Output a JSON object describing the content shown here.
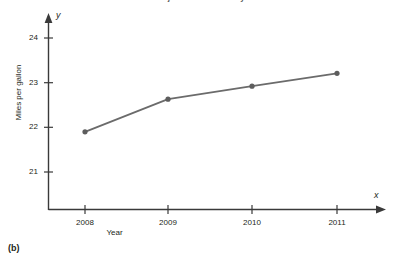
{
  "figure": {
    "label": "(b)",
    "title_fragment": "Projected fuel economy"
  },
  "chart_data": {
    "type": "line",
    "title": "",
    "xlabel": "Year",
    "ylabel": "Miles per gallon",
    "x_axis_variable": "x",
    "y_axis_variable": "y",
    "categories": [
      "2008",
      "2009",
      "2010",
      "2011"
    ],
    "x_tick_labels": [
      "2008",
      "2009",
      "2010",
      "2011"
    ],
    "y_tick_labels": [
      "21",
      "22",
      "23",
      "24"
    ],
    "y_ticks": [
      21,
      22,
      23,
      24
    ],
    "values": [
      21.9,
      22.63,
      22.92,
      23.21
    ],
    "series": [
      {
        "name": "Miles per gallon",
        "values": [
          21.9,
          22.63,
          22.92,
          23.21
        ]
      }
    ],
    "points": [
      {
        "x": "2008",
        "y": 21.9
      },
      {
        "x": "2009",
        "y": 22.63
      },
      {
        "x": "2010",
        "y": 22.92
      },
      {
        "x": "2011",
        "y": 23.21
      }
    ],
    "ylim": [
      20.4,
      24.4
    ],
    "grid": false,
    "legend": "none",
    "marker": "circle",
    "line_color": "#6b6b6b",
    "marker_color": "#5d5d5d",
    "axis_color": "#3a3a3a",
    "axis_arrows": true
  }
}
